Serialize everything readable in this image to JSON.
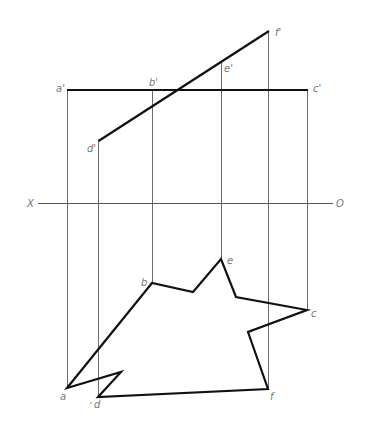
{
  "axis": {
    "left_label": "X",
    "right_label": "O"
  },
  "front_view": {
    "labels": {
      "a": "a'",
      "b": "b'",
      "c": "c'",
      "d": "d'",
      "e": "e'",
      "f": "f'"
    },
    "description": "Horizontal line a'-c' and inclined line d'-f' passing through e'"
  },
  "top_view": {
    "labels": {
      "a": "a",
      "b": "b",
      "c": "c",
      "d": "d",
      "e": "e",
      "f": "f"
    },
    "polygon_vertex_order": [
      "a",
      "b",
      "valley-1",
      "e",
      "bend-1",
      "c",
      "notch-1",
      "f",
      "d",
      "notch-2",
      "a"
    ],
    "description": "Irregular star-like polygon in plan view"
  },
  "colors": {
    "object_line": "#111111",
    "projection_line": "#6a6a6a",
    "label": "#777777",
    "background": "#ffffff"
  }
}
